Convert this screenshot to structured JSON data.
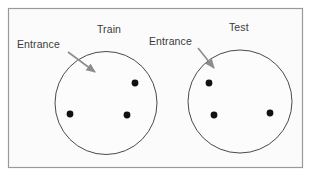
{
  "figure": {
    "title_hidden": "",
    "background_color": "#ffffff",
    "panel_fill": "#fbfbfb",
    "panel_border_color": "#9a9a9a",
    "panel": {
      "x": 8,
      "y": 8,
      "width": 295,
      "height": 160
    },
    "circle_stroke_color": "#4a4a4a",
    "circle_fill": "#fcfcfc",
    "dot_color": "#111111",
    "arrow_color": "#8c8c8c",
    "label_color": "#3a3a3a"
  },
  "panels": [
    {
      "name": "train",
      "title": "Train",
      "title_position": {
        "x": 97,
        "y": 23
      },
      "entrance_label": "Entrance",
      "entrance_label_position": {
        "x": 17,
        "y": 38
      },
      "circle": {
        "cx": 106,
        "cy": 103,
        "rx": 51,
        "ry": 51.5
      },
      "arrow": {
        "x1": 68,
        "y1": 52,
        "x2": 95,
        "y2": 72
      },
      "dots": [
        {
          "id": "train-dot-1",
          "cx": 135,
          "cy": 83,
          "r": 3.4
        },
        {
          "id": "train-dot-2",
          "cx": 70,
          "cy": 114,
          "r": 3.4
        },
        {
          "id": "train-dot-3",
          "cx": 127,
          "cy": 115,
          "r": 3.4
        }
      ]
    },
    {
      "name": "test",
      "title": "Test",
      "title_position": {
        "x": 229,
        "y": 21
      },
      "entrance_label": "Entrance",
      "entrance_label_position": {
        "x": 149,
        "y": 35
      },
      "circle": {
        "cx": 240,
        "cy": 101.5,
        "rx": 52,
        "ry": 51.5
      },
      "arrow": {
        "x1": 198,
        "y1": 48,
        "x2": 214,
        "y2": 68
      },
      "dots": [
        {
          "id": "test-dot-1",
          "cx": 209,
          "cy": 83,
          "r": 3.4
        },
        {
          "id": "test-dot-2",
          "cx": 214,
          "cy": 115,
          "r": 3.4
        },
        {
          "id": "test-dot-3",
          "cx": 270,
          "cy": 113,
          "r": 3.4
        }
      ]
    }
  ]
}
